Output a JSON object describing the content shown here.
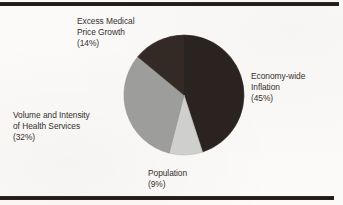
{
  "chart_data": {
    "type": "pie",
    "title": "",
    "subtitle": "",
    "xlabel": "",
    "ylabel": "",
    "legend_position": "none",
    "grid": false,
    "start_angle_deg": 0,
    "direction": "clockwise",
    "categories": [
      "Economy-wide Inflation",
      "Population",
      "Volume and Intensity of Health Services",
      "Excess Medical Price Growth"
    ],
    "values": [
      45,
      9,
      32,
      14
    ],
    "value_unit": "%",
    "slices": [
      {
        "name": "Economy-wide Inflation",
        "value": 45,
        "label_lines": [
          "Economy-wide",
          "Inflation"
        ],
        "percent_text": "(45%)",
        "color": "#2a2320"
      },
      {
        "name": "Population",
        "value": 9,
        "label_lines": [
          "Population"
        ],
        "percent_text": "(9%)",
        "color": "#cfcfcd"
      },
      {
        "name": "Volume and Intensity of Health Services",
        "value": 32,
        "label_lines": [
          "Volume and Intensity",
          "of Health Services"
        ],
        "percent_text": "(32%)",
        "color": "#9d9d9b"
      },
      {
        "name": "Excess Medical Price Growth",
        "value": 14,
        "label_lines": [
          "Excess Medical",
          "Price Growth"
        ],
        "percent_text": "(14%)",
        "color": "#332a26"
      }
    ]
  },
  "labels": {
    "excess": {
      "line1": "Excess Medical",
      "line2": "Price Growth",
      "percent": "(14%)"
    },
    "economy": {
      "line1": "Economy-wide",
      "line2": "Inflation",
      "percent": "(45%)"
    },
    "volume": {
      "line1": "Volume and Intensity",
      "line2": "of Health Services",
      "percent": "(32%)"
    },
    "population": {
      "line1": "Population",
      "percent": "(9%)"
    }
  },
  "colors": {
    "economy_slice": "#2a2320",
    "population_slice": "#cfcfcd",
    "volume_slice": "#9d9d9b",
    "excess_slice": "#332a26",
    "rule": "#221b18",
    "text": "#35302e",
    "background": "#fbfaf8"
  }
}
